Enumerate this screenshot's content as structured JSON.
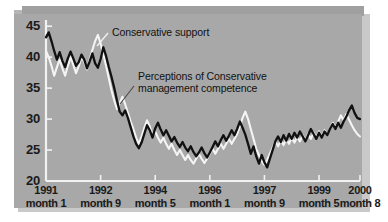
{
  "figure": {
    "background_color": "#ffffff",
    "panel_color": "#a8a8a8",
    "bevel_color": "#a0a0a0",
    "shadow_color": "#c9c9c9"
  },
  "chart_data": {
    "type": "line",
    "title": "",
    "xlabel": "",
    "ylabel": "",
    "ylim": [
      20,
      46
    ],
    "xlim": [
      0,
      116
    ],
    "grid": false,
    "legend_position": "inline-annotations",
    "yticks": [
      20,
      25,
      30,
      35,
      40,
      45
    ],
    "ytick_labels": [
      "20",
      "25",
      "30",
      "35",
      "40",
      "45"
    ],
    "xticks": [
      0,
      20,
      40,
      60,
      80,
      100,
      115
    ],
    "xtick_years": [
      "1991",
      "1992",
      "1994",
      "1996",
      "1997",
      "1999",
      "2000"
    ],
    "xtick_months": [
      "month 1",
      "month 9",
      "month 5",
      "month 1",
      "month 9",
      "month 5",
      "month 8"
    ],
    "annotations": [
      {
        "text": "Conservative support",
        "series": "conservative-support",
        "x_px": 112,
        "y_px": 26
      },
      {
        "text": "Perceptions of Conservative\nmanagement competence",
        "series": "perceptions-of-competence",
        "x_px": 138,
        "y_px": 70
      }
    ],
    "series": [
      {
        "name": "Conservative support",
        "color": "#111111",
        "values": [
          43.2,
          44.0,
          42.6,
          41.0,
          39.6,
          40.8,
          39.4,
          38.4,
          39.8,
          40.9,
          39.8,
          38.6,
          39.2,
          40.4,
          39.6,
          38.2,
          39.3,
          40.6,
          39.0,
          38.3,
          39.7,
          41.6,
          40.2,
          38.4,
          36.8,
          35.0,
          33.0,
          31.2,
          30.6,
          31.4,
          30.2,
          28.7,
          27.2,
          26.0,
          25.3,
          26.2,
          27.6,
          29.0,
          28.2,
          27.0,
          28.5,
          29.4,
          28.3,
          27.4,
          28.2,
          27.3,
          26.4,
          27.1,
          26.2,
          25.5,
          26.3,
          25.4,
          24.8,
          25.6,
          24.7,
          24.0,
          24.6,
          25.4,
          24.5,
          23.8,
          24.6,
          25.5,
          26.4,
          25.6,
          26.6,
          27.4,
          26.5,
          27.3,
          28.2,
          27.4,
          28.4,
          29.6,
          28.6,
          27.5,
          26.0,
          24.4,
          25.6,
          24.0,
          22.8,
          24.2,
          23.0,
          22.2,
          23.6,
          25.0,
          26.4,
          27.2,
          26.3,
          27.4,
          26.5,
          27.6,
          26.8,
          27.8,
          27.0,
          28.0,
          27.2,
          26.4,
          27.4,
          28.4,
          27.6,
          26.8,
          27.8,
          27.0,
          28.0,
          27.4,
          28.4,
          29.2,
          28.4,
          29.4,
          28.6,
          29.6,
          30.4,
          31.4,
          32.2,
          31.0,
          30.2,
          30.0
        ]
      },
      {
        "name": "Perceptions of Conservative management competence",
        "color": "#f4f4f4",
        "values": [
          41.0,
          40.0,
          38.6,
          37.0,
          38.4,
          39.6,
          38.2,
          37.0,
          38.6,
          40.0,
          38.8,
          37.4,
          38.6,
          40.0,
          39.2,
          38.0,
          39.6,
          41.2,
          42.6,
          43.6,
          42.2,
          40.4,
          38.6,
          36.6,
          34.6,
          33.0,
          31.6,
          32.6,
          33.6,
          32.4,
          31.0,
          29.6,
          28.4,
          27.0,
          26.0,
          27.2,
          28.6,
          29.8,
          28.8,
          27.4,
          28.0,
          27.0,
          26.2,
          27.0,
          26.0,
          25.2,
          26.0,
          25.0,
          24.2,
          25.0,
          24.2,
          23.4,
          24.2,
          23.4,
          22.8,
          23.6,
          24.4,
          23.6,
          22.9,
          23.6,
          24.4,
          25.2,
          24.4,
          25.2,
          26.0,
          25.2,
          26.0,
          26.8,
          26.0,
          26.8,
          27.6,
          28.8,
          30.2,
          31.2,
          30.0,
          28.4,
          26.8,
          25.2,
          24.2,
          23.2,
          22.6,
          23.4,
          24.4,
          25.4,
          26.4,
          25.6,
          26.6,
          25.8,
          26.8,
          26.0,
          27.0,
          26.2,
          27.2,
          26.4,
          27.4,
          26.6,
          27.6,
          26.8,
          27.8,
          27.0,
          28.0,
          27.2,
          28.2,
          27.4,
          28.4,
          29.4,
          28.6,
          29.6,
          30.6,
          29.8,
          30.8,
          29.9,
          29.0,
          28.2,
          27.6,
          27.2
        ]
      }
    ]
  }
}
